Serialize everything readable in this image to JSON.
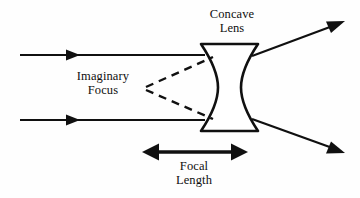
{
  "diagram": {
    "kind": "optics-ray-diagram",
    "background_color": "#fefefe",
    "ink_color": "#101010",
    "labels": {
      "lens_title": {
        "line1": "Concave",
        "line2": "Lens"
      },
      "focus": {
        "line1": "Imaginary",
        "line2": "Focus"
      },
      "focal": {
        "line1": "Focal",
        "line2": "Length"
      }
    },
    "elements": {
      "incoming_ray_top": "parallel incident ray, upper",
      "incoming_ray_bottom": "parallel incident ray, lower",
      "outgoing_ray_top": "diverged refracted ray, upper",
      "outgoing_ray_bottom": "diverged refracted ray, lower",
      "lens": "biconcave lens body",
      "dashed_ray_top": "virtual backward extension, upper",
      "dashed_ray_bottom": "virtual backward extension, lower",
      "focal_length_arrow": "double headed measurement arrow"
    },
    "geometry": {
      "lens_left_x": 201,
      "lens_right_x": 258,
      "lens_top_y": 44,
      "lens_bottom_y": 131,
      "ray_top_y": 55,
      "ray_bottom_y": 120,
      "virtual_focus_x": 144,
      "virtual_focus_y": 88,
      "focal_arrow_y": 152,
      "focal_arrow_x1": 144,
      "focal_arrow_x2": 246
    }
  }
}
